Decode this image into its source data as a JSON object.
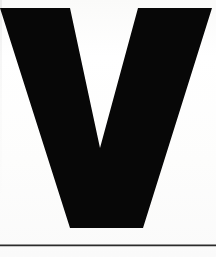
{
  "page": {
    "kind": "scanned-page-fragment",
    "width": 216,
    "height": 257,
    "background_color": "#fefefe",
    "ink_color": "#070707"
  },
  "glyph": {
    "character": "V",
    "name": "letter-v",
    "style": "bold-sans-serif-display",
    "color": "#070707",
    "alt_text": "V",
    "outline_points": "0,8 70,8 100,148 138,8 212,8 143,228 70,228",
    "bounds": {
      "left": 0,
      "top": 8,
      "right": 212,
      "bottom": 228
    },
    "inner_notch": {
      "top_left_x": 70,
      "top_right_x": 138,
      "apex_x": 100,
      "apex_y": 148
    },
    "baseline_foot": {
      "left_x": 70,
      "right_x": 143,
      "y": 228
    }
  },
  "rule": {
    "name": "horizontal-rule",
    "color": "#2b2b2b",
    "y": 245,
    "x_start": 0,
    "x_end": 216,
    "thickness": 1.6
  }
}
